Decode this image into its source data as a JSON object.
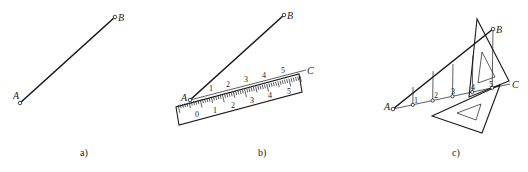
{
  "figure": {
    "panels": [
      {
        "caption": "a)",
        "points": {
          "A": "A",
          "B": "B"
        }
      },
      {
        "caption": "b)",
        "points": {
          "A": "A",
          "B": "B",
          "C": "C"
        },
        "ruler_top_numbers": [
          "1",
          "2",
          "3",
          "4",
          "5"
        ],
        "ruler_scale_numbers": [
          "0",
          "1",
          "2",
          "3",
          "4",
          "5"
        ]
      },
      {
        "caption": "c)",
        "points": {
          "A": "A",
          "B": "B",
          "C": "C"
        },
        "division_labels": [
          "1",
          "2",
          "3",
          "4",
          "5"
        ]
      }
    ]
  }
}
